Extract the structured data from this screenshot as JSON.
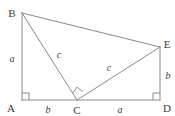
{
  "figure": {
    "type": "geometry-diagram",
    "background_color": "#ffffff",
    "line_color": "#8a8a8a",
    "label_color": "#3a3a3a"
  },
  "vertices": [
    {
      "id": "A",
      "label": "A",
      "x": 22,
      "y": 100,
      "label_x": 12,
      "label_y": 110
    },
    {
      "id": "B",
      "label": "B",
      "x": 22,
      "y": 13,
      "label_x": 12,
      "label_y": 12
    },
    {
      "id": "C",
      "label": "C",
      "x": 77,
      "y": 100,
      "label_x": 77,
      "label_y": 113
    },
    {
      "id": "D",
      "label": "D",
      "x": 160,
      "y": 100,
      "label_x": 166,
      "label_y": 110
    },
    {
      "id": "E",
      "label": "E",
      "x": 160,
      "y": 47,
      "label_x": 166,
      "label_y": 45
    }
  ],
  "segments": [
    {
      "id": "AB",
      "from": "A",
      "to": "B",
      "x1": 22,
      "y1": 100,
      "x2": 22,
      "y2": 13
    },
    {
      "id": "AD",
      "from": "A",
      "to": "D",
      "x1": 22,
      "y1": 100,
      "x2": 160,
      "y2": 100
    },
    {
      "id": "BE",
      "from": "B",
      "to": "E",
      "x1": 22,
      "y1": 13,
      "x2": 160,
      "y2": 47
    },
    {
      "id": "BC",
      "from": "B",
      "to": "C",
      "x1": 22,
      "y1": 13,
      "x2": 77,
      "y2": 100
    },
    {
      "id": "CE",
      "from": "C",
      "to": "E",
      "x1": 77,
      "y1": 100,
      "x2": 160,
      "y2": 47
    },
    {
      "id": "ED",
      "from": "E",
      "to": "D",
      "x1": 160,
      "y1": 47,
      "x2": 160,
      "y2": 100
    }
  ],
  "side_labels": [
    {
      "id": "AB-label",
      "text": "a",
      "for_segment": "AB",
      "x": 12,
      "y": 59
    },
    {
      "id": "AC-label",
      "text": "b",
      "for_segment": "AC",
      "x": 48,
      "y": 111
    },
    {
      "id": "BC-label",
      "text": "c",
      "for_segment": "BC",
      "x": 59,
      "y": 55
    },
    {
      "id": "CE-label",
      "text": "c",
      "for_segment": "CE",
      "x": 109,
      "y": 68
    },
    {
      "id": "CD-label",
      "text": "a",
      "for_segment": "CD",
      "x": 120,
      "y": 111
    },
    {
      "id": "ED-label",
      "text": "b",
      "for_segment": "ED",
      "x": 167,
      "y": 76
    }
  ],
  "right_angle_marks": [
    {
      "id": "angle-A",
      "at_vertex": "A",
      "note": "right angle between AB and AD"
    },
    {
      "id": "angle-C",
      "at_vertex": "C",
      "note": "right angle between CB and CE"
    },
    {
      "id": "angle-D",
      "at_vertex": "D",
      "note": "right angle between DE and DA"
    }
  ]
}
